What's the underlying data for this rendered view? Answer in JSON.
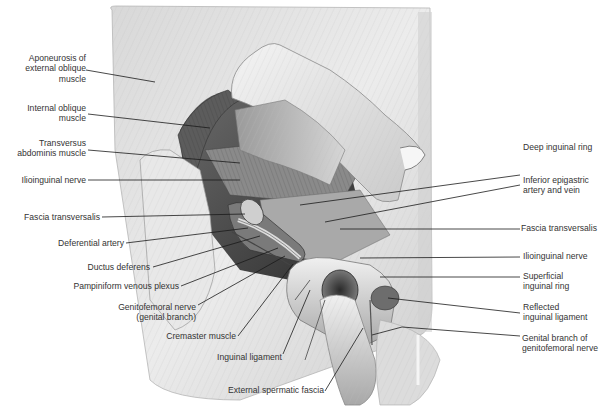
{
  "figure": {
    "type": "anatomical illustration",
    "colors": {
      "background": "#ffffff",
      "tissue_light": "#e6e6e6",
      "tissue_mid": "#bdbdbd",
      "tissue_dark": "#555555",
      "leader_line": "#1a1a1a",
      "label_text": "#333333"
    }
  },
  "labels_left": [
    {
      "id": "aponeurosis-external-oblique",
      "lines": [
        "Aponeurosis of",
        "external oblique",
        "muscle"
      ]
    },
    {
      "id": "internal-oblique",
      "lines": [
        "Internal oblique",
        "muscle"
      ]
    },
    {
      "id": "transversus-abdominis",
      "lines": [
        "Transversus",
        "abdominis muscle"
      ]
    },
    {
      "id": "ilioinguinal-nerve-left",
      "lines": [
        "Ilioinguinal nerve"
      ]
    },
    {
      "id": "fascia-transversalis-left",
      "lines": [
        "Fascia transversalis"
      ]
    },
    {
      "id": "deferential-artery",
      "lines": [
        "Deferential artery"
      ]
    },
    {
      "id": "ductus-deferens",
      "lines": [
        "Ductus deferens"
      ]
    },
    {
      "id": "pampiniform-plexus",
      "lines": [
        "Pampiniform venous plexus"
      ]
    },
    {
      "id": "genitofemoral-genital-branch",
      "lines": [
        "Genitofemoral nerve",
        "(genital branch)"
      ]
    },
    {
      "id": "cremaster-muscle",
      "lines": [
        "Cremaster muscle"
      ]
    }
  ],
  "labels_bottom": [
    {
      "id": "inguinal-ligament",
      "lines": [
        "Inguinal ligament"
      ]
    },
    {
      "id": "external-spermatic-fascia",
      "lines": [
        "External spermatic fascia"
      ]
    }
  ],
  "labels_right": [
    {
      "id": "deep-inguinal-ring",
      "lines": [
        "Deep inguinal ring"
      ]
    },
    {
      "id": "inferior-epigastric",
      "lines": [
        "Inferior epigastric",
        "artery and vein"
      ]
    },
    {
      "id": "fascia-transversalis-right",
      "lines": [
        "Fascia transversalis"
      ]
    },
    {
      "id": "ilioinguinal-nerve-right",
      "lines": [
        "Ilioinguinal nerve"
      ]
    },
    {
      "id": "superficial-inguinal-ring",
      "lines": [
        "Superficial",
        "inguinal ring"
      ]
    },
    {
      "id": "reflected-inguinal-ligament",
      "lines": [
        "Reflected",
        "inguinal ligament"
      ]
    },
    {
      "id": "genital-branch-genitofemoral",
      "lines": [
        "Genital branch of",
        "genitofemoral nerve"
      ]
    }
  ]
}
